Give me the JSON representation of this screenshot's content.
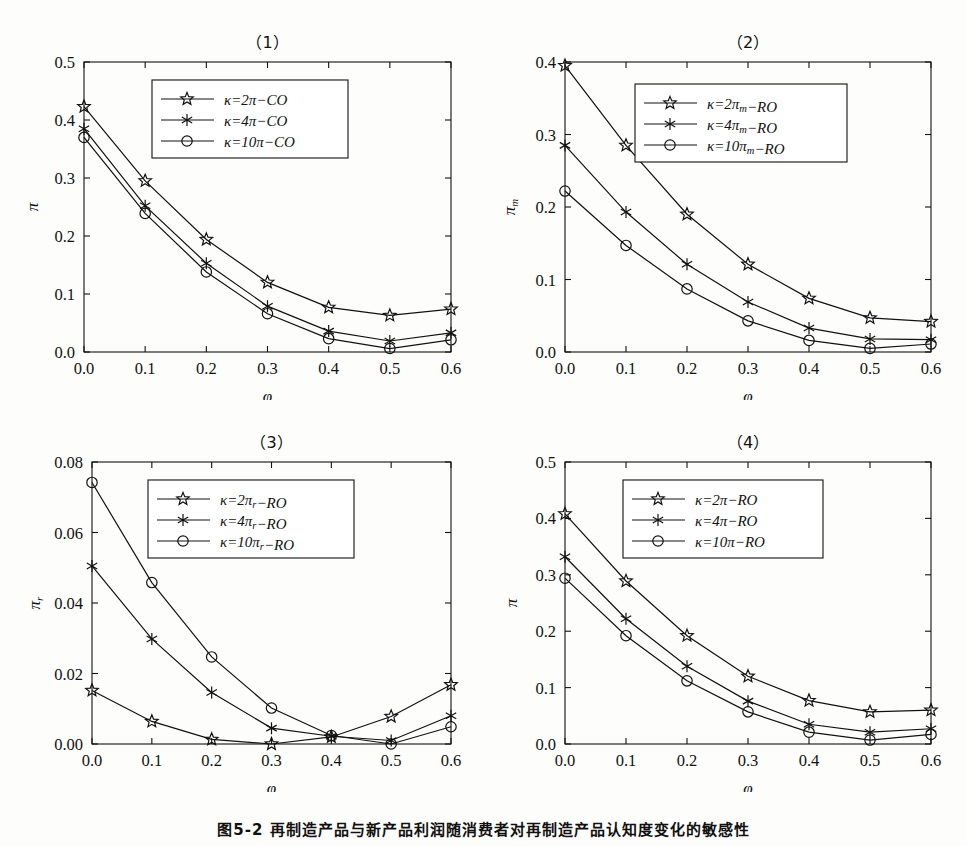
{
  "figure": {
    "caption": "图5-2  再制造产品与新产品利润随消费者对再制造产品认知度变化的敏感性",
    "axis_color": "#111111",
    "background": "#fdfdfc"
  },
  "chart_data": [
    {
      "type": "line",
      "title": "（1）",
      "xlabel": "φ",
      "ylabel": "π",
      "x": [
        0.0,
        0.1,
        0.2,
        0.3,
        0.4,
        0.5,
        0.6
      ],
      "xticks": [
        "0.0",
        "0.1",
        "0.2",
        "0.3",
        "0.4",
        "0.5",
        "0.6"
      ],
      "yticks": [
        "0.0",
        "0.1",
        "0.2",
        "0.3",
        "0.4",
        "0.5"
      ],
      "xlim": [
        0.0,
        0.6
      ],
      "ylim": [
        0.0,
        0.5
      ],
      "grid": false,
      "legend_position": "top-center",
      "series": [
        {
          "name": "κ=2π−CO",
          "marker": "star",
          "values": [
            0.423,
            0.295,
            0.194,
            0.12,
            0.077,
            0.063,
            0.074
          ]
        },
        {
          "name": "κ=4π−CO",
          "marker": "asterisk",
          "values": [
            0.385,
            0.252,
            0.153,
            0.079,
            0.036,
            0.019,
            0.033
          ]
        },
        {
          "name": "κ=10π−CO",
          "marker": "circle",
          "values": [
            0.37,
            0.239,
            0.138,
            0.066,
            0.023,
            0.006,
            0.021
          ]
        }
      ]
    },
    {
      "type": "line",
      "title": "（2）",
      "xlabel": "φ",
      "ylabel": "πm",
      "x": [
        0.0,
        0.1,
        0.2,
        0.3,
        0.4,
        0.5,
        0.6
      ],
      "xticks": [
        "0.0",
        "0.1",
        "0.2",
        "0.3",
        "0.4",
        "0.5",
        "0.6"
      ],
      "yticks": [
        "0.0",
        "0.1",
        "0.2",
        "0.3",
        "0.4"
      ],
      "xlim": [
        0.0,
        0.6
      ],
      "ylim": [
        0.0,
        0.4
      ],
      "grid": false,
      "legend_position": "top-center",
      "series": [
        {
          "name": "κ=2πm−RO",
          "marker": "star",
          "values": [
            0.395,
            0.285,
            0.19,
            0.121,
            0.074,
            0.047,
            0.042
          ]
        },
        {
          "name": "κ=4πm−RO",
          "marker": "asterisk",
          "values": [
            0.285,
            0.193,
            0.121,
            0.069,
            0.033,
            0.018,
            0.017
          ]
        },
        {
          "name": "κ=10πm−RO",
          "marker": "circle",
          "values": [
            0.222,
            0.147,
            0.087,
            0.043,
            0.016,
            0.005,
            0.011
          ]
        }
      ]
    },
    {
      "type": "line",
      "title": "（3）",
      "xlabel": "φ",
      "ylabel": "πr",
      "x": [
        0.0,
        0.1,
        0.2,
        0.3,
        0.4,
        0.5,
        0.6
      ],
      "xticks": [
        "0.0",
        "0.1",
        "0.2",
        "0.3",
        "0.4",
        "0.5",
        "0.6"
      ],
      "yticks": [
        "0.00",
        "0.02",
        "0.04",
        "0.06",
        "0.08"
      ],
      "xlim": [
        0.0,
        0.6
      ],
      "ylim": [
        0.0,
        0.08
      ],
      "grid": false,
      "legend_position": "top-center",
      "series": [
        {
          "name": "κ=2πr−RO",
          "marker": "star",
          "values": [
            0.0152,
            0.0064,
            0.0013,
            0.0,
            0.002,
            0.0078,
            0.0168
          ]
        },
        {
          "name": "κ=4πr−RO",
          "marker": "asterisk",
          "values": [
            0.0505,
            0.0298,
            0.0146,
            0.0045,
            0.0022,
            0.001,
            0.008
          ]
        },
        {
          "name": "κ=10πr−RO",
          "marker": "circle",
          "values": [
            0.0742,
            0.0458,
            0.0247,
            0.0102,
            0.0024,
            0.0,
            0.0049
          ]
        }
      ]
    },
    {
      "type": "line",
      "title": "（4）",
      "xlabel": "φ",
      "ylabel": "π",
      "x": [
        0.0,
        0.1,
        0.2,
        0.3,
        0.4,
        0.5,
        0.6
      ],
      "xticks": [
        "0.0",
        "0.1",
        "0.2",
        "0.3",
        "0.4",
        "0.5",
        "0.6"
      ],
      "yticks": [
        "0.0",
        "0.1",
        "0.2",
        "0.3",
        "0.4",
        "0.5"
      ],
      "xlim": [
        0.0,
        0.5
      ],
      "ylim": [
        0.0,
        0.5
      ],
      "grid": false,
      "legend_position": "top-center",
      "series": [
        {
          "name": "κ=2π−RO",
          "marker": "star",
          "values": [
            0.408,
            0.289,
            0.192,
            0.12,
            0.077,
            0.057,
            0.06
          ]
        },
        {
          "name": "κ=4π−RO",
          "marker": "asterisk",
          "values": [
            0.332,
            0.222,
            0.138,
            0.076,
            0.035,
            0.021,
            0.027
          ]
        },
        {
          "name": "κ=10π−RO",
          "marker": "circle",
          "values": [
            0.294,
            0.192,
            0.112,
            0.057,
            0.021,
            0.007,
            0.017
          ]
        }
      ]
    }
  ]
}
